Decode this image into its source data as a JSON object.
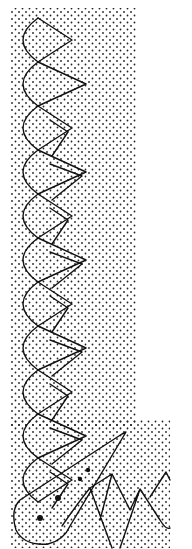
{
  "illustration": {
    "subject": "stippled lace border pattern",
    "width": 192,
    "height": 549,
    "colors": {
      "ink": "#111111",
      "paper": "#ffffff"
    },
    "stipple_region": {
      "x": 10,
      "y": 8,
      "w": 126,
      "h": 540
    },
    "bottom_extension": {
      "x": 60,
      "y": 425,
      "w": 110,
      "h": 124
    },
    "chain": {
      "left_x": 14,
      "mid_x": 38,
      "right_x": 72,
      "start_y": 18,
      "cell_h": 44,
      "cells": 11
    },
    "tassel": {
      "tip": [
        126,
        432
      ],
      "base_cx": 40,
      "base_cy": 520
    },
    "large_dots": [
      [
        88,
        470
      ],
      [
        80,
        479
      ],
      [
        58,
        498
      ],
      [
        40,
        518
      ]
    ],
    "bottom_points": [
      [
        112,
        474
      ],
      [
        140,
        489
      ],
      [
        166,
        472
      ]
    ]
  }
}
